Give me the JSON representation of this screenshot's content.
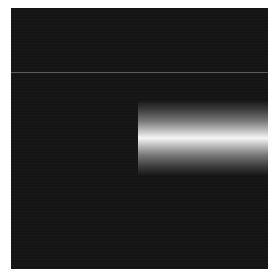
{
  "image": {
    "description": "Dark square field with a horizontal bright gradient band (light beam) entering from the right edge",
    "background_color": "#ffffff",
    "panel": {
      "color": "#151515",
      "x": 11,
      "y": 8,
      "width": 257,
      "height": 261
    },
    "faint_line": {
      "y": 72,
      "color": "#5a5a5a"
    },
    "beam": {
      "x_start": 138,
      "x_end": 268,
      "y_top": 100,
      "y_bottom": 176,
      "peak_y": 138,
      "peak_color": "#f6f6f6",
      "edge_color": "#151515"
    }
  }
}
